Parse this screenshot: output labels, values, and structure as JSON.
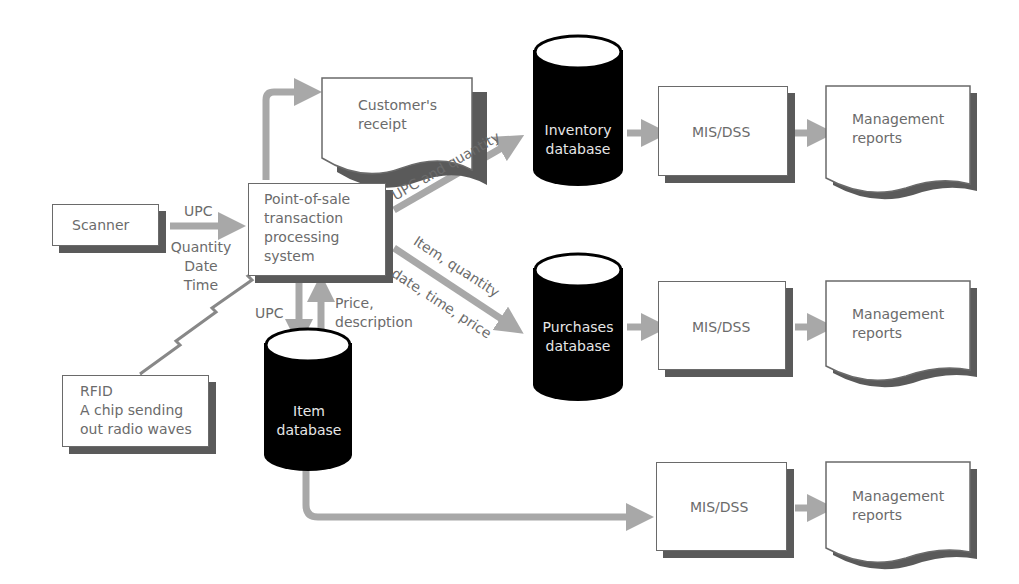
{
  "diagram": {
    "type": "flowchart",
    "nodes": {
      "scanner": {
        "label": "Scanner",
        "shape": "rectangle"
      },
      "pos": {
        "label": "Point-of-sale\ntransaction\nprocessing\nsystem",
        "shape": "rectangle"
      },
      "receipt": {
        "label": "Customer's\nreceipt",
        "shape": "document"
      },
      "rfid": {
        "label": "RFID\nA chip sending\nout radio waves",
        "shape": "rectangle"
      },
      "inventory_db": {
        "label": "Inventory\ndatabase",
        "shape": "cylinder"
      },
      "purchases_db": {
        "label": "Purchases\ndatabase",
        "shape": "cylinder"
      },
      "item_db": {
        "label": "Item\ndatabase",
        "shape": "cylinder"
      },
      "mis1": {
        "label": "MIS/DSS",
        "shape": "rectangle"
      },
      "mis2": {
        "label": "MIS/DSS",
        "shape": "rectangle"
      },
      "mis3": {
        "label": "MIS/DSS",
        "shape": "rectangle"
      },
      "reports1": {
        "label": "Management\nreports",
        "shape": "document"
      },
      "reports2": {
        "label": "Management\nreports",
        "shape": "document"
      },
      "reports3": {
        "label": "Management\nreports",
        "shape": "document"
      }
    },
    "edges": {
      "scanner_to_pos_top": "UPC",
      "scanner_to_pos_bottom": "Quantity\nDate\nTime",
      "pos_to_inventory": "UPC and quantity",
      "pos_to_purchases_top": "Item, quantity",
      "pos_to_purchases_bottom": "date, time, price",
      "pos_to_item": "UPC",
      "item_to_pos": "Price,\ndescription"
    },
    "colors": {
      "arrow": "#a8a8a8",
      "border": "#6a6a6a",
      "shadow": "#5a5a5a",
      "cylinder": "#000000",
      "text": "#6b6b6b"
    }
  }
}
